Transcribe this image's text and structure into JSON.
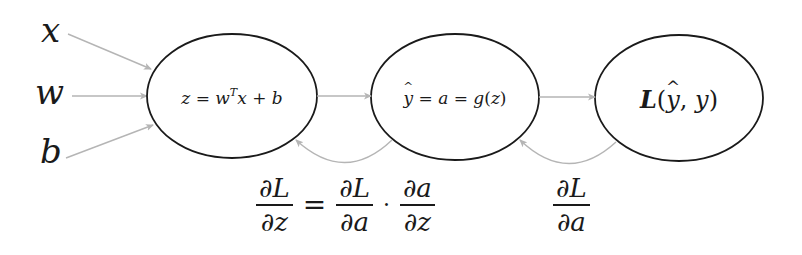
{
  "diagram": {
    "type": "computation-graph",
    "title": "",
    "colors": {
      "stroke": "#1a1a1a",
      "arrow": "#b5b5b5",
      "background": "#ffffff"
    },
    "inputs": [
      {
        "id": "x",
        "label": "x",
        "x": 40,
        "y": 14,
        "arrow": {
          "x1": 68,
          "y1": 34,
          "x2": 151,
          "y2": 69
        }
      },
      {
        "id": "w",
        "label": "w",
        "x": 36,
        "y": 74,
        "arrow": {
          "x1": 72,
          "y1": 96,
          "x2": 147,
          "y2": 96
        }
      },
      {
        "id": "b",
        "label": "b",
        "x": 40,
        "y": 134,
        "arrow": {
          "x1": 66,
          "y1": 158,
          "x2": 153,
          "y2": 125
        }
      }
    ],
    "nodes": [
      {
        "id": "linear",
        "cx": 232,
        "cy": 96,
        "rx": 85,
        "ry": 62,
        "label_parts": {
          "lhs": "z",
          "eq": " = ",
          "w": "w",
          "sup": "T",
          "x": "x",
          "plus": " + ",
          "b": "b"
        }
      },
      {
        "id": "activation",
        "cx": 455,
        "cy": 97,
        "rx": 84,
        "ry": 63,
        "label_parts": {
          "yhat": "y",
          "eq1": " = ",
          "a": "a",
          "eq2": " = ",
          "g": "g",
          "lp": "(",
          "z": "z",
          "rp": ")"
        }
      },
      {
        "id": "loss",
        "cx": 679,
        "cy": 98,
        "rx": 84,
        "ry": 63,
        "label_parts": {
          "L": "L",
          "lp": "(",
          "yhat": "y",
          "comma": ", ",
          "y": "y",
          "rp": ")"
        }
      }
    ],
    "forward_edges": [
      {
        "from": "linear",
        "to": "activation",
        "x1": 317,
        "y1": 96,
        "x2": 371,
        "y2": 96
      },
      {
        "from": "activation",
        "to": "loss",
        "x1": 539,
        "y1": 97,
        "x2": 595,
        "y2": 97
      }
    ],
    "backward_edges": [
      {
        "from": "activation",
        "to": "linear",
        "path": "M 392 140 Q 345 185 296 140"
      },
      {
        "from": "loss",
        "to": "activation",
        "path": "M 616 142 Q 568 186 520 140"
      }
    ],
    "equations": {
      "dLdz": {
        "num": "∂L",
        "den": "∂z",
        "eq": "=",
        "t1_num": "∂L",
        "t1_den": "∂a",
        "dot": "·",
        "t2_num": "∂a",
        "t2_den": "∂z"
      },
      "dLda": {
        "num": "∂L",
        "den": "∂a"
      }
    }
  }
}
